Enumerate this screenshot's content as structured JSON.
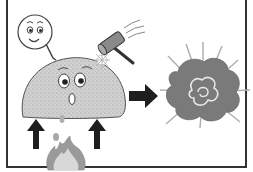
{
  "illustration": {
    "subject": "dust-explosion-diagram",
    "elements": [
      {
        "name": "thought-bubble-face",
        "expression": "smiling"
      },
      {
        "name": "dust-mound-character",
        "expression": "surprised"
      },
      {
        "name": "hammer",
        "action": "striking"
      },
      {
        "name": "spark"
      },
      {
        "name": "flame"
      },
      {
        "name": "up-arrow-left"
      },
      {
        "name": "up-arrow-right"
      },
      {
        "name": "right-arrow"
      },
      {
        "name": "explosion-cloud"
      }
    ]
  },
  "colors": {
    "border": "#333333",
    "dust_fill": "#c8c8c8",
    "explosion_fill": "#7a7a7a",
    "explosion_rays": "#b0b0b0",
    "arrow": "#1e1e1e",
    "flame_outer": "#9a9a9a",
    "flame_inner": "#d8d8d8",
    "hammer_head": "#8a8a8a"
  }
}
